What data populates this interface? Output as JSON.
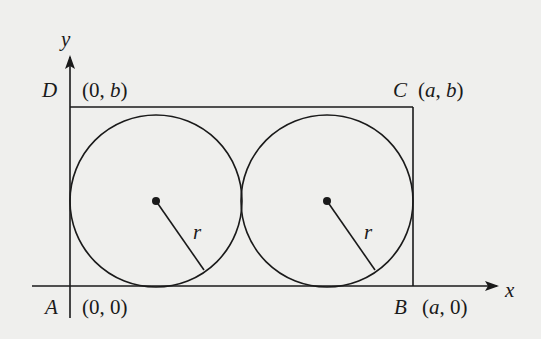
{
  "diagram": {
    "axes": {
      "x_label": "x",
      "y_label": "y"
    },
    "points": {
      "A": {
        "name": "A",
        "coord_open": "(",
        "coord": "0, 0",
        "coord_close": ")"
      },
      "B": {
        "name": "B",
        "coord_open": "(",
        "coord_var": "a",
        "coord_rest": ", 0",
        "coord_close": ")"
      },
      "C": {
        "name": "C",
        "coord_open": "(",
        "coord_var": "a",
        "coord_sep": ", ",
        "coord_var2": "b",
        "coord_close": ")"
      },
      "D": {
        "name": "D",
        "coord_open": "(",
        "coord_pre": "0, ",
        "coord_var": "b",
        "coord_close": ")"
      }
    },
    "circles": [
      {
        "radius_label": "r"
      },
      {
        "radius_label": "r"
      }
    ],
    "colors": {
      "background": "#efefed",
      "stroke": "#1a1a1a"
    }
  }
}
